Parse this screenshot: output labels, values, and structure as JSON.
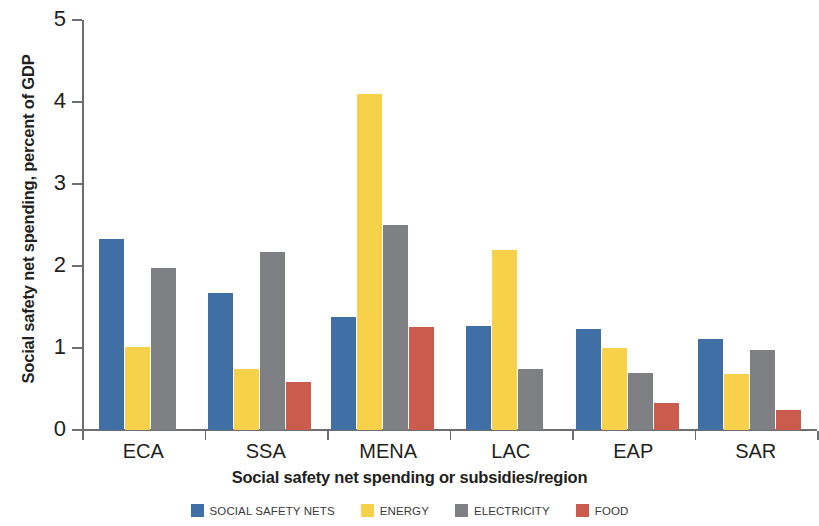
{
  "chart_data": {
    "type": "bar",
    "title": "",
    "xlabel": "Social safety net spending or subsidies/region",
    "ylabel": "Social safety net spending, percent of GDP",
    "ylim": [
      0,
      5
    ],
    "yticks": [
      0,
      1,
      2,
      3,
      4,
      5
    ],
    "ytick_labels": [
      "0",
      "1",
      "2",
      "3",
      "4",
      "5"
    ],
    "grid": false,
    "legend_position": "bottom",
    "categories": [
      "ECA",
      "SSA",
      "MENA",
      "LAC",
      "EAP",
      "SAR"
    ],
    "series": [
      {
        "name": "SOCIAL SAFETY NETS",
        "color": "#3F6FA5",
        "values": [
          2.33,
          1.67,
          1.38,
          1.27,
          1.23,
          1.11
        ]
      },
      {
        "name": "ENERGY",
        "color": "#F8D14A",
        "values": [
          1.01,
          0.75,
          4.1,
          2.19,
          1.0,
          0.68
        ]
      },
      {
        "name": "ELECTRICITY",
        "color": "#7E8084",
        "values": [
          1.97,
          2.17,
          2.5,
          0.75,
          0.69,
          0.97
        ]
      },
      {
        "name": "FOOD",
        "color": "#CB5B4C",
        "values": [
          null,
          0.59,
          1.26,
          null,
          0.33,
          0.25
        ]
      }
    ]
  },
  "legend": {
    "items": [
      {
        "label": "SOCIAL SAFETY NETS",
        "color": "#3F6FA5",
        "swatch": "legend-swatch-social-safety-nets"
      },
      {
        "label": "ENERGY",
        "color": "#F8D14A",
        "swatch": "legend-swatch-energy"
      },
      {
        "label": "ELECTRICITY",
        "color": "#7E8084",
        "swatch": "legend-swatch-electricity"
      },
      {
        "label": "FOOD",
        "color": "#CB5B4C",
        "swatch": "legend-swatch-food"
      }
    ]
  }
}
